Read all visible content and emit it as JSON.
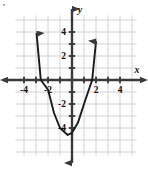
{
  "figure": {
    "background": "#ffffff",
    "grid_color": "#d2d2d2",
    "axis_color": "#3a3a3a",
    "curve_color": "#1a1a1a",
    "label_color": "#111111"
  },
  "axis_titles": {
    "x": "x",
    "y": "y"
  },
  "chart_data": {
    "type": "line",
    "title": "",
    "subtitle": "",
    "xlabel": "x",
    "ylabel": "y",
    "grid": true,
    "legend": "none",
    "xlim": [
      -4.75,
      5.4
    ],
    "ylim": [
      -5.4,
      5.4
    ],
    "x_ticks": [
      -4,
      -2,
      2,
      4
    ],
    "x_tick_labels": [
      "-4",
      "-2",
      "2",
      "4"
    ],
    "y_ticks": [
      4,
      2,
      -2,
      -4
    ],
    "y_tick_labels": [
      "4",
      "2",
      "-2",
      "-4"
    ],
    "grid_step": 1,
    "curve": {
      "name": "parabola",
      "shape": "upward-opening parabola",
      "equation": "y = 1.4x^2 + x - 4.4",
      "vertex": [
        -0.36,
        -4.58
      ],
      "x_intercepts": [
        -2.6,
        1.68
      ],
      "y_intercept": -4.4,
      "arrowheads": [
        "left-arm-up",
        "right-arm-up"
      ],
      "points": [
        {
          "x": -2.95,
          "y": 3.85
        },
        {
          "x": -2.6,
          "y": 0.0
        },
        {
          "x": -2.0,
          "y": -0.8
        },
        {
          "x": -1.5,
          "y": -2.75
        },
        {
          "x": -1.0,
          "y": -4.0
        },
        {
          "x": -0.36,
          "y": -4.58
        },
        {
          "x": 0.0,
          "y": -4.4
        },
        {
          "x": 0.5,
          "y": -3.55
        },
        {
          "x": 1.0,
          "y": -2.0
        },
        {
          "x": 1.68,
          "y": 0.0
        },
        {
          "x": 2.0,
          "y": 3.2
        }
      ]
    },
    "axes_arrows": {
      "x_positive": true,
      "x_negative": true,
      "y_positive": true,
      "y_negative": true
    }
  }
}
